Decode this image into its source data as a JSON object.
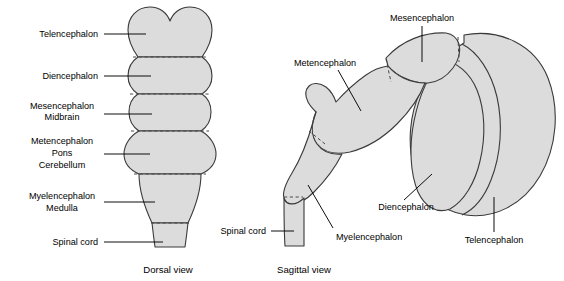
{
  "figure": {
    "background_color": "#ffffff",
    "region_fill_color": "#dcdcdc",
    "region_stroke_color": "#3a3a3a",
    "divider_stroke_color": "#4a4a4a",
    "leader_line_color": "#000000",
    "text_color": "#000000"
  },
  "dorsal_view": {
    "caption": "Dorsal view",
    "labels": [
      {
        "id": "telencephalon",
        "lines": [
          "Telencephalon"
        ],
        "align": "end"
      },
      {
        "id": "diencephalon",
        "lines": [
          "Diencephalon"
        ],
        "align": "end"
      },
      {
        "id": "mesencephalon",
        "lines": [
          "Mesencephalon",
          "Midbrain"
        ],
        "align": "center"
      },
      {
        "id": "metencephalon",
        "lines": [
          "Metencephalon",
          "Pons",
          "Cerebellum"
        ],
        "align": "center"
      },
      {
        "id": "myelencephalon",
        "lines": [
          "Myelencephalon",
          "Medulla"
        ],
        "align": "center"
      },
      {
        "id": "spinal-cord",
        "lines": [
          "Spinal cord"
        ],
        "align": "end"
      }
    ]
  },
  "sagittal_view": {
    "caption": "Sagittal view",
    "labels": [
      {
        "id": "mesencephalon",
        "lines": [
          "Mesencephalon"
        ],
        "align": "middle"
      },
      {
        "id": "metencephalon",
        "lines": [
          "Metencephalon"
        ],
        "align": "middle"
      },
      {
        "id": "spinal-cord",
        "lines": [
          "Spinal cord"
        ],
        "align": "end"
      },
      {
        "id": "myelencephalon",
        "lines": [
          "Myelencephalon"
        ],
        "align": "start"
      },
      {
        "id": "diencephalon",
        "lines": [
          "Diencephalon"
        ],
        "align": "middle"
      },
      {
        "id": "telencephalon",
        "lines": [
          "Telencephalon"
        ],
        "align": "middle"
      }
    ]
  },
  "text": {
    "dorsal_caption": "Dorsal view",
    "sagittal_caption": "Sagittal view",
    "telencephalon": "Telencephalon",
    "diencephalon": "Diencephalon",
    "mesencephalon": "Mesencephalon",
    "midbrain": "Midbrain",
    "metencephalon": "Metencephalon",
    "pons": "Pons",
    "cerebellum": "Cerebellum",
    "myelencephalon": "Myelencephalon",
    "medulla": "Medulla",
    "spinal_cord": "Spinal cord"
  }
}
